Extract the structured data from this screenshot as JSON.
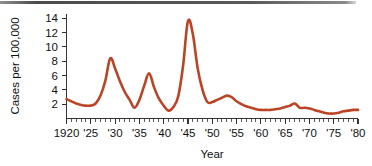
{
  "chart_data": {
    "type": "line",
    "title": "",
    "xlabel": "Year",
    "ylabel": "Cases per 100,000",
    "xlim": [
      1920,
      1980
    ],
    "ylim": [
      0,
      14.6
    ],
    "grid": false,
    "legend": null,
    "series_color": "#bc4426",
    "x_tick_labels": [
      "1920",
      "'25",
      "'30",
      "'35",
      "'40",
      "'45",
      "'50",
      "'55",
      "'60",
      "'65",
      "'70",
      "'75",
      "'80"
    ],
    "x_tick_values": [
      1920,
      1925,
      1930,
      1935,
      1940,
      1945,
      1950,
      1955,
      1960,
      1965,
      1970,
      1975,
      1980
    ],
    "x_minor_tick_step": 1,
    "y_tick_labels": [
      "2",
      "4",
      "6",
      "8",
      "10",
      "12",
      "14"
    ],
    "y_tick_values": [
      2,
      4,
      6,
      8,
      10,
      12,
      14
    ],
    "series": [
      {
        "name": "Cases per 100,000",
        "x": [
          1920,
          1921,
          1922,
          1923,
          1924,
          1925,
          1926,
          1927,
          1928,
          1929,
          1930,
          1931,
          1932,
          1933,
          1934,
          1935,
          1936,
          1937,
          1938,
          1939,
          1940,
          1941,
          1942,
          1943,
          1944,
          1945,
          1946,
          1947,
          1948,
          1949,
          1950,
          1951,
          1952,
          1953,
          1954,
          1955,
          1956,
          1957,
          1958,
          1959,
          1960,
          1961,
          1962,
          1963,
          1964,
          1965,
          1966,
          1967,
          1968,
          1969,
          1970,
          1971,
          1972,
          1973,
          1974,
          1975,
          1976,
          1977,
          1978,
          1979,
          1980
        ],
        "y": [
          2.7,
          2.4,
          2.1,
          1.9,
          1.8,
          1.8,
          2.1,
          3.2,
          5.3,
          8.4,
          7.0,
          5.2,
          3.7,
          2.6,
          1.5,
          2.6,
          4.6,
          6.3,
          4.4,
          2.8,
          1.8,
          1.1,
          1.6,
          3.1,
          7.4,
          13.6,
          11.8,
          7.0,
          4.0,
          2.3,
          2.3,
          2.6,
          2.9,
          3.2,
          3.0,
          2.4,
          2.0,
          1.7,
          1.5,
          1.3,
          1.2,
          1.2,
          1.2,
          1.3,
          1.4,
          1.6,
          1.8,
          2.1,
          1.5,
          1.5,
          1.4,
          1.2,
          1.0,
          0.8,
          0.7,
          0.7,
          0.8,
          1.0,
          1.1,
          1.2,
          1.2
        ]
      }
    ]
  },
  "axis": {
    "y_label": "Cases per 100,000",
    "x_label": "Year"
  }
}
